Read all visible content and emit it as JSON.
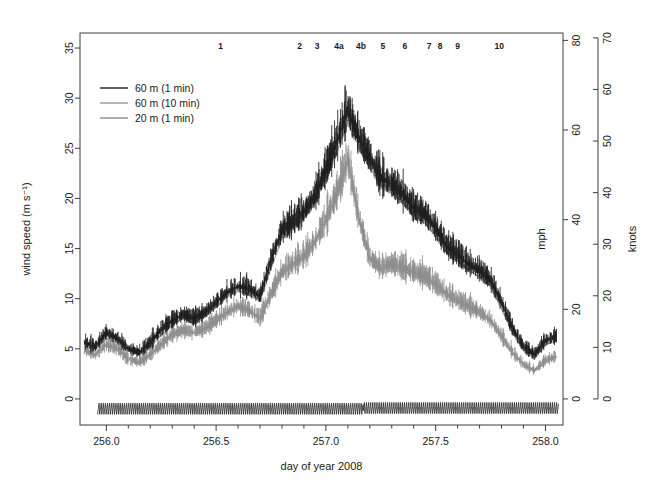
{
  "chart_data": {
    "type": "line",
    "title": "",
    "xlabel": "day of year 2008",
    "ylabel": "wind speed (m s⁻¹)",
    "ylabel_right_1": "mph",
    "ylabel_right_2": "knots",
    "xlim": [
      255.88,
      258.08
    ],
    "ylim": [
      -2.6,
      36.5
    ],
    "x_ticks": [
      256.0,
      256.5,
      257.0,
      257.5,
      258.0
    ],
    "x_tick_labels": [
      "256.0",
      "256.5",
      "257.0",
      "257.5",
      "258.0"
    ],
    "x_minor_step": 0.1,
    "y_ticks": [
      0,
      5,
      10,
      15,
      20,
      25,
      30,
      35
    ],
    "y_tick_labels": [
      "0",
      "5",
      "10",
      "15",
      "20",
      "25",
      "30",
      "35"
    ],
    "y_right_mph_ticks": [
      0,
      20,
      40,
      60,
      80
    ],
    "y_right_mph_labels": [
      "0",
      "20",
      "40",
      "60",
      "80"
    ],
    "y_right_knots_ticks": [
      0,
      10,
      20,
      30,
      40,
      50,
      60,
      70
    ],
    "y_right_knots_labels": [
      "0",
      "10",
      "20",
      "30",
      "40",
      "50",
      "60",
      "70"
    ],
    "grid": false,
    "legend_position": "upper-left",
    "colors": {
      "series_60m_1min": "#1c1c1c",
      "series_60m_10min": "#9a9a9a",
      "series_20m_1min": "#8c8c8c",
      "direction_trace": "#1c1c1c",
      "axis": "#3c3c3c"
    },
    "series": [
      {
        "name": "60 m (1 min)",
        "color": "#1c1c1c",
        "sampling": "1 min",
        "height_m": 60,
        "x": [
          255.9,
          255.95,
          256.0,
          256.05,
          256.1,
          256.15,
          256.2,
          256.25,
          256.3,
          256.35,
          256.4,
          256.45,
          256.5,
          256.55,
          256.6,
          256.65,
          256.7,
          256.75,
          256.8,
          256.85,
          256.9,
          256.95,
          257.0,
          257.05,
          257.1,
          257.15,
          257.2,
          257.25,
          257.3,
          257.35,
          257.4,
          257.45,
          257.5,
          257.55,
          257.6,
          257.65,
          257.7,
          257.75,
          257.8,
          257.85,
          257.9,
          257.95,
          258.0,
          258.05
        ],
        "values": [
          5.6,
          5.2,
          6.6,
          6.0,
          5.0,
          4.6,
          5.6,
          6.9,
          7.8,
          8.4,
          8.0,
          8.6,
          9.6,
          10.6,
          11.2,
          11.0,
          10.2,
          13.8,
          16.8,
          17.6,
          18.6,
          20.2,
          22.8,
          25.6,
          28.8,
          26.0,
          24.0,
          22.0,
          21.4,
          20.4,
          19.0,
          18.4,
          17.0,
          15.2,
          14.4,
          13.4,
          12.8,
          11.8,
          9.6,
          7.0,
          5.2,
          4.4,
          5.8,
          6.2
        ],
        "peak_value": 33.0,
        "peak_x": 257.1,
        "noise_band_m_s": 5.0
      },
      {
        "name": "60 m (10 min)",
        "color": "#9a9a9a",
        "sampling": "10 min",
        "height_m": 60,
        "x": [
          255.9,
          255.95,
          256.0,
          256.05,
          256.1,
          256.15,
          256.2,
          256.25,
          256.3,
          256.35,
          256.4,
          256.45,
          256.5,
          256.55,
          256.6,
          256.65,
          256.7,
          256.75,
          256.8,
          256.85,
          256.9,
          256.95,
          257.0,
          257.05,
          257.1,
          257.15,
          257.2,
          257.25,
          257.3,
          257.35,
          257.4,
          257.45,
          257.5,
          257.55,
          257.6,
          257.65,
          257.7,
          257.75,
          257.8,
          257.85,
          257.9,
          257.95,
          258.0,
          258.05
        ],
        "values": [
          5.2,
          5.0,
          6.0,
          5.6,
          4.8,
          4.4,
          5.2,
          6.4,
          7.4,
          8.0,
          7.6,
          8.2,
          9.2,
          10.2,
          10.8,
          10.4,
          9.8,
          13.0,
          16.0,
          17.0,
          18.0,
          19.6,
          22.0,
          24.6,
          27.6,
          25.2,
          23.2,
          21.2,
          20.6,
          19.6,
          18.2,
          17.6,
          16.2,
          14.6,
          13.8,
          12.8,
          12.2,
          11.2,
          9.0,
          6.6,
          4.8,
          4.0,
          5.4,
          5.8
        ],
        "peak_value": 28.0,
        "peak_x": 257.1
      },
      {
        "name": "20 m (1 min)",
        "color": "#8c8c8c",
        "sampling": "1 min",
        "height_m": 20,
        "x": [
          255.9,
          255.95,
          256.0,
          256.05,
          256.1,
          256.15,
          256.2,
          256.25,
          256.3,
          256.35,
          256.4,
          256.45,
          256.5,
          256.55,
          256.6,
          256.65,
          256.7,
          256.75,
          256.8,
          256.85,
          256.9,
          256.95,
          257.0,
          257.05,
          257.1,
          257.15,
          257.2,
          257.25,
          257.3,
          257.35,
          257.4,
          257.45,
          257.5,
          257.55,
          257.6,
          257.65,
          257.7,
          257.75,
          257.8,
          257.85,
          257.9,
          257.95,
          258.0,
          258.05
        ],
        "values": [
          4.8,
          4.4,
          5.4,
          5.0,
          4.0,
          3.6,
          4.4,
          5.4,
          6.4,
          6.8,
          6.6,
          7.0,
          7.8,
          8.6,
          9.2,
          8.8,
          8.0,
          10.4,
          12.6,
          13.4,
          14.2,
          15.6,
          17.8,
          20.4,
          23.8,
          18.0,
          14.0,
          13.0,
          13.4,
          13.0,
          12.6,
          12.2,
          11.4,
          10.4,
          9.8,
          9.2,
          8.6,
          7.8,
          6.2,
          4.6,
          3.4,
          2.8,
          3.8,
          4.2
        ],
        "peak_value": 26.0,
        "peak_x": 257.1
      }
    ],
    "bottom_trace": {
      "name": "direction/sawtooth trace",
      "color": "#1c1c1c",
      "baseline": -1.0,
      "amplitude": 1.2,
      "x_start": 255.96,
      "x_end": 258.06,
      "phase_shift_x": 257.17,
      "description": "high-frequency sawtooth oscillation below zero"
    },
    "top_annotations": [
      {
        "label": "1",
        "x": 256.52
      },
      {
        "label": "2",
        "x": 256.88
      },
      {
        "label": "3",
        "x": 256.96
      },
      {
        "label": "4a",
        "x": 257.06
      },
      {
        "label": "4b",
        "x": 257.16
      },
      {
        "label": "5",
        "x": 257.26
      },
      {
        "label": "6",
        "x": 257.36
      },
      {
        "label": "7",
        "x": 257.47
      },
      {
        "label": "8",
        "x": 257.52
      },
      {
        "label": "9",
        "x": 257.6
      },
      {
        "label": "10",
        "x": 257.79
      }
    ],
    "legend": [
      {
        "label": "60 m (1 min)",
        "color": "#1c1c1c"
      },
      {
        "label": "60 m (10 min)",
        "color": "#9a9a9a"
      },
      {
        "label": "20 m (1 min)",
        "color": "#8c8c8c"
      }
    ]
  }
}
